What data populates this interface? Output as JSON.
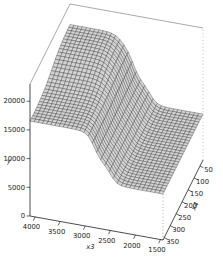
{
  "figure": {
    "width": 223,
    "height": 262,
    "background": "#ffffff",
    "kind": "R persp() style 3D wireframe surface plot"
  },
  "chart_data": {
    "type": "surface3d",
    "title": "",
    "x_axis": {
      "label": "x3",
      "tick_labels": [
        "4000",
        "3500",
        "3000",
        "2500",
        "2000",
        "1500"
      ],
      "tick_values": [
        4000,
        3500,
        3000,
        2500,
        2000,
        1500
      ],
      "range": [
        1450,
        4100
      ],
      "reversed": true
    },
    "y_axis": {
      "label": "x4",
      "tick_labels": [
        "350",
        "300",
        "250",
        "200",
        "150",
        "100",
        "50"
      ],
      "tick_values": [
        350,
        300,
        250,
        200,
        150,
        100,
        50
      ],
      "range": [
        25,
        360
      ]
    },
    "z_axis": {
      "label": "y",
      "tick_labels": [
        "0",
        "5000",
        "10000",
        "15000",
        "20000"
      ],
      "tick_values": [
        0,
        5000,
        10000,
        15000,
        20000
      ],
      "range": [
        0,
        23000
      ]
    },
    "surface": {
      "description": "step/plateau response surface: low flat plain for small x3, narrow intermediate ledge, high plateau for large x3, plus an extra raised top plateau for large x3 combined with small x4",
      "base_level": 8000,
      "steps_x3": [
        {
          "center": 2500,
          "width": 70,
          "height": 3500
        },
        {
          "center": 2820,
          "width": 70,
          "height": 5000
        }
      ],
      "interaction_bump": {
        "height": 3000,
        "x3_center": 3040,
        "x3_width": 90,
        "x4_center": 175,
        "x4_width": 40
      },
      "levels": {
        "lower_plain": 8000,
        "ledge": 11600,
        "upper_plateau": 16500,
        "top_plateau": 19400
      },
      "grid_cells": {
        "x3": 32,
        "x4": 30
      }
    },
    "style": {
      "facet_fill": "#d4d4d4",
      "mesh_stroke": "#1c1c1c",
      "axis_color": "#000000",
      "box_edge_color": "#555555",
      "hidden_edge_color": "#999999",
      "label_color": "#222222"
    },
    "legend": null,
    "grid": "wireframe mesh on surface, no background grid"
  }
}
